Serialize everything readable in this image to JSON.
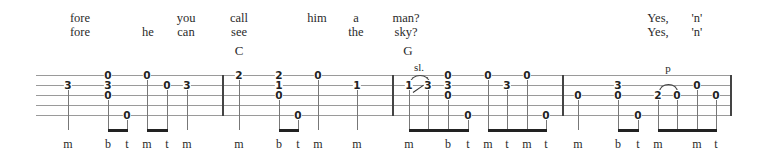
{
  "lyrics": {
    "line1": [
      {
        "text": "fore",
        "x": 80
      },
      {
        "text": "you",
        "x": 186
      },
      {
        "text": "call",
        "x": 239
      },
      {
        "text": "him",
        "x": 317
      },
      {
        "text": "a",
        "x": 356
      },
      {
        "text": "man?",
        "x": 406
      },
      {
        "text": "Yes,",
        "x": 658
      },
      {
        "text": "'n'",
        "x": 697
      }
    ],
    "line2": [
      {
        "text": "fore",
        "x": 80
      },
      {
        "text": "he",
        "x": 148
      },
      {
        "text": "can",
        "x": 186
      },
      {
        "text": "see",
        "x": 239
      },
      {
        "text": "the",
        "x": 356
      },
      {
        "text": "sky?",
        "x": 406
      },
      {
        "text": "Yes,",
        "x": 658
      },
      {
        "text": "'n'",
        "x": 697
      }
    ]
  },
  "chords": [
    {
      "name": "C",
      "x": 239
    },
    {
      "name": "G",
      "x": 408
    }
  ],
  "tab": {
    "strings": 5,
    "measures": 3,
    "notes": [
      {
        "fret": "3",
        "string": 2,
        "x": 68
      },
      {
        "fret": "0",
        "string": 1,
        "x": 108
      },
      {
        "fret": "3",
        "string": 2,
        "x": 108
      },
      {
        "fret": "0",
        "string": 3,
        "x": 108
      },
      {
        "fret": "0",
        "string": 5,
        "x": 127
      },
      {
        "fret": "0",
        "string": 1,
        "x": 147
      },
      {
        "fret": "0",
        "string": 2,
        "x": 167
      },
      {
        "fret": "3",
        "string": 2,
        "x": 187
      },
      {
        "fret": "2",
        "string": 1,
        "x": 239
      },
      {
        "fret": "2",
        "string": 1,
        "x": 279
      },
      {
        "fret": "1",
        "string": 2,
        "x": 279
      },
      {
        "fret": "0",
        "string": 3,
        "x": 279
      },
      {
        "fret": "0",
        "string": 5,
        "x": 298
      },
      {
        "fret": "0",
        "string": 1,
        "x": 318
      },
      {
        "fret": "1",
        "string": 2,
        "x": 357
      },
      {
        "fret": "1",
        "string": 2,
        "x": 409
      },
      {
        "fret": "3",
        "string": 2,
        "x": 428
      },
      {
        "fret": "0",
        "string": 1,
        "x": 448
      },
      {
        "fret": "3",
        "string": 2,
        "x": 448
      },
      {
        "fret": "0",
        "string": 3,
        "x": 448
      },
      {
        "fret": "0",
        "string": 5,
        "x": 468
      },
      {
        "fret": "0",
        "string": 1,
        "x": 488
      },
      {
        "fret": "3",
        "string": 2,
        "x": 507
      },
      {
        "fret": "0",
        "string": 1,
        "x": 527
      },
      {
        "fret": "0",
        "string": 5,
        "x": 546
      },
      {
        "fret": "0",
        "string": 3,
        "x": 578
      },
      {
        "fret": "3",
        "string": 2,
        "x": 618
      },
      {
        "fret": "0",
        "string": 3,
        "x": 618
      },
      {
        "fret": "0",
        "string": 5,
        "x": 638
      },
      {
        "fret": "2",
        "string": 3,
        "x": 658
      },
      {
        "fret": "0",
        "string": 3,
        "x": 677
      },
      {
        "fret": "0",
        "string": 2,
        "x": 697
      },
      {
        "fret": "0",
        "string": 3,
        "x": 716
      }
    ],
    "marks": [
      {
        "text": "sl.",
        "x": 419,
        "y": 61
      },
      {
        "text": "p",
        "x": 668,
        "y": 62
      }
    ]
  },
  "fingering": [
    {
      "text": "m",
      "x": 68
    },
    {
      "text": "b",
      "x": 108
    },
    {
      "text": "t",
      "x": 127
    },
    {
      "text": "m",
      "x": 147
    },
    {
      "text": "t",
      "x": 167
    },
    {
      "text": "m",
      "x": 187
    },
    {
      "text": "m",
      "x": 239
    },
    {
      "text": "b",
      "x": 279
    },
    {
      "text": "t",
      "x": 298
    },
    {
      "text": "m",
      "x": 318
    },
    {
      "text": "m",
      "x": 357
    },
    {
      "text": "m",
      "x": 409
    },
    {
      "text": "b",
      "x": 448
    },
    {
      "text": "t",
      "x": 468
    },
    {
      "text": "m",
      "x": 488
    },
    {
      "text": "t",
      "x": 507
    },
    {
      "text": "m",
      "x": 527
    },
    {
      "text": "t",
      "x": 546
    },
    {
      "text": "m",
      "x": 578
    },
    {
      "text": "b",
      "x": 618
    },
    {
      "text": "t",
      "x": 638
    },
    {
      "text": "m",
      "x": 658
    },
    {
      "text": "m",
      "x": 697
    },
    {
      "text": "t",
      "x": 716
    }
  ]
}
